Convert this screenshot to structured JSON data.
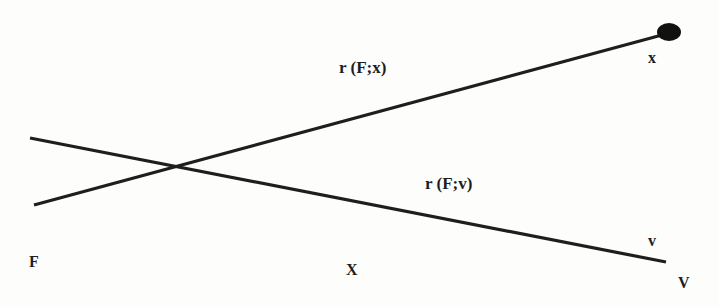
{
  "diagram": {
    "type": "line-diagram",
    "colors": {
      "background": "#fdfdfc",
      "stroke": "#1e1e1e",
      "text": "#1e1e1e"
    },
    "lines": [
      {
        "id": "r-F-x",
        "label": "r (F;x)",
        "from": [
          34,
          205
        ],
        "to": [
          662,
          35
        ],
        "end_marker": "filled-ellipse"
      },
      {
        "id": "r-F-v",
        "label": "r (F;v)",
        "from": [
          30,
          138
        ],
        "to": [
          666,
          262
        ],
        "end_marker": "none"
      }
    ],
    "intersection": [
      175,
      167
    ],
    "endpoint_dot": {
      "cx": 669,
      "cy": 32,
      "rx": 12,
      "ry": 9
    },
    "labels": {
      "line_x": "r (F;x)",
      "line_v": "r (F;v)",
      "point_x": "x",
      "point_v": "v",
      "point_V": "V",
      "point_F": "F",
      "point_X": "X"
    }
  }
}
